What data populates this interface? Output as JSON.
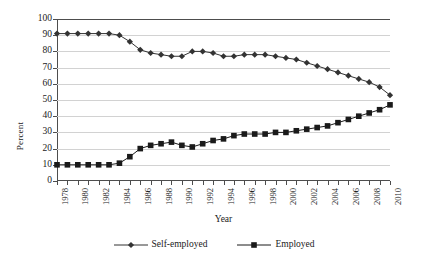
{
  "chart_data": {
    "type": "line",
    "title": "",
    "xlabel": "Year",
    "ylabel": "Percent",
    "xlim": [
      1978,
      2010
    ],
    "ylim": [
      0,
      100
    ],
    "ytick_step": 10,
    "grid": "horizontal",
    "legend_position": "bottom",
    "x": [
      1978,
      1979,
      1980,
      1981,
      1982,
      1983,
      1984,
      1985,
      1986,
      1987,
      1988,
      1989,
      1990,
      1991,
      1992,
      1993,
      1994,
      1995,
      1996,
      1997,
      1998,
      1999,
      2000,
      2001,
      2002,
      2003,
      2004,
      2005,
      2006,
      2007,
      2008,
      2009,
      2010
    ],
    "xtick_labels": [
      "1978",
      "1980",
      "1982",
      "1984",
      "1986",
      "1988",
      "1990",
      "1992",
      "1994",
      "1996",
      "1998",
      "2000",
      "2002",
      "2004",
      "2006",
      "2008",
      "2010"
    ],
    "ytick_labels": [
      "0",
      "10",
      "20",
      "30",
      "40",
      "50",
      "60",
      "70",
      "80",
      "90",
      "100"
    ],
    "series": [
      {
        "name": "Self-employed",
        "marker": "diamond",
        "color": "#333333",
        "values": [
          91,
          91,
          91,
          91,
          91,
          91,
          90,
          86,
          81,
          79,
          78,
          77,
          77,
          80,
          80,
          79,
          77,
          77,
          78,
          78,
          78,
          77,
          76,
          75,
          73,
          71,
          69,
          67,
          65,
          63,
          61,
          58,
          53
        ]
      },
      {
        "name": "Employed",
        "marker": "square",
        "color": "#1a1a1a",
        "values": [
          10,
          10,
          10,
          10,
          10,
          10,
          11,
          15,
          20,
          22,
          23,
          24,
          22,
          21,
          23,
          25,
          26,
          28,
          29,
          29,
          29,
          30,
          30,
          31,
          32,
          33,
          34,
          36,
          38,
          40,
          42,
          44,
          47
        ]
      }
    ]
  },
  "legend": {
    "items": [
      {
        "label": "Self-employed"
      },
      {
        "label": "Employed"
      }
    ]
  },
  "axes": {
    "x_title": "Year",
    "y_title": "Percent"
  }
}
